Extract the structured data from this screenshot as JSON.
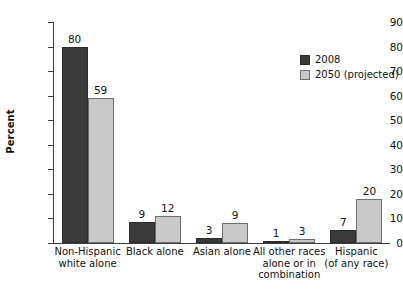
{
  "chart_data": {
    "type": "bar",
    "title": "",
    "subtitle": "",
    "xlabel": "",
    "ylabel": "Percent",
    "ylim": [
      0,
      90
    ],
    "ytick_step": 10,
    "yticks": [
      "90",
      "80",
      "70",
      "60",
      "50",
      "40",
      "30",
      "20",
      "10",
      "0"
    ],
    "grid": false,
    "legend_position": "top-right",
    "categories": [
      "Non-Hispanic\nwhite alone",
      "Black alone",
      "Asian alone",
      "All other races\nalone or in\ncombination",
      "Hispanic\n(of any race)"
    ],
    "category_lines": [
      [
        "Non-Hispanic",
        "white alone"
      ],
      [
        "Black alone"
      ],
      [
        "Asian alone"
      ],
      [
        "All other races",
        "alone or in",
        "combination"
      ],
      [
        "Hispanic",
        "(of any race)"
      ]
    ],
    "series": [
      {
        "name": "2008",
        "color": "#3a3a3a",
        "values": [
          80,
          9,
          3,
          1,
          7
        ],
        "labels": [
          "80",
          "9",
          "3",
          "1",
          "7"
        ],
        "drawn_heights": [
          80,
          8.5,
          2.2,
          0.7,
          5.4
        ]
      },
      {
        "name": "2050 (projected)",
        "color": "#c9c9c9",
        "values": [
          59,
          12,
          9,
          3,
          20
        ],
        "labels": [
          "59",
          "12",
          "9",
          "3",
          "20"
        ],
        "drawn_heights": [
          59,
          11.2,
          8.0,
          1.7,
          18.0
        ]
      }
    ]
  },
  "colors": {
    "series_2008": "#3a3a3a",
    "series_2050": "#c9c9c9",
    "axis": "#3d3d3d",
    "background": "#ffffff",
    "text": "#111111"
  },
  "legend": {
    "items": [
      {
        "label": "2008",
        "swatch": "series_2008"
      },
      {
        "label": "2050 (projected)",
        "swatch": "series_2050"
      }
    ]
  }
}
